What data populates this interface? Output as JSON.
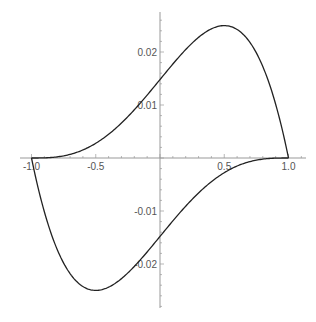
{
  "chart_data": {
    "type": "line",
    "title": "",
    "xlabel": "",
    "ylabel": "",
    "xlim": [
      -1.0,
      1.0
    ],
    "ylim": [
      -0.027,
      0.027
    ],
    "grid": false,
    "legend": null,
    "x_ticks": [
      -1.0,
      -0.5,
      0.5,
      1.0
    ],
    "x_tick_labels": [
      "-1.0",
      "-0.5",
      "0.5",
      "1.0"
    ],
    "y_ticks": [
      -0.02,
      -0.01,
      0.01,
      0.02
    ],
    "y_tick_labels": [
      "-0.02",
      "-0.01",
      "0.01",
      "0.02"
    ],
    "series": [
      {
        "name": "upper",
        "x": [
          -1.0,
          -0.9,
          -0.8,
          -0.7,
          -0.6,
          -0.5,
          -0.4,
          -0.3,
          -0.2,
          -0.1,
          0.0,
          0.1,
          0.2,
          0.3,
          0.4,
          0.5,
          0.6,
          0.7,
          0.8,
          0.9,
          1.0
        ],
        "y": [
          0.0,
          3e-05,
          0.00021,
          0.00068,
          0.00152,
          0.00278,
          0.00447,
          0.0066,
          0.0091,
          0.0119,
          0.0148,
          0.01772,
          0.02046,
          0.02276,
          0.02437,
          0.02498,
          0.02427,
          0.02182,
          0.01726,
          0.01015,
          0.0
        ]
      },
      {
        "name": "lower",
        "x": [
          -1.0,
          -0.9,
          -0.8,
          -0.7,
          -0.6,
          -0.5,
          -0.4,
          -0.3,
          -0.2,
          -0.1,
          0.0,
          0.1,
          0.2,
          0.3,
          0.4,
          0.5,
          0.6,
          0.7,
          0.8,
          0.9,
          1.0
        ],
        "y": [
          0.0,
          -0.01015,
          -0.01726,
          -0.02182,
          -0.02427,
          -0.02498,
          -0.02437,
          -0.02276,
          -0.02046,
          -0.01772,
          -0.0148,
          -0.0119,
          -0.0091,
          -0.0066,
          -0.00447,
          -0.00278,
          -0.00152,
          -0.00068,
          -0.00021,
          -3e-05,
          0.0
        ]
      }
    ]
  }
}
